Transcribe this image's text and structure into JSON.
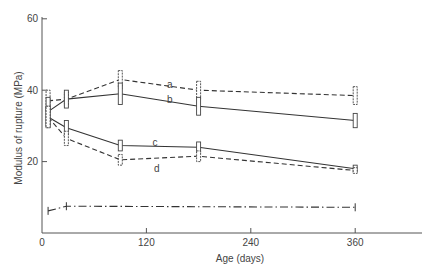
{
  "chart_data": {
    "type": "line",
    "title": "",
    "xlabel": "Age (days)",
    "ylabel": "Modulus of rupture (MPa)",
    "xlim": [
      0,
      440
    ],
    "ylim": [
      0,
      62
    ],
    "xticks": [
      0,
      120,
      240,
      360
    ],
    "yticks": [
      20,
      40,
      60
    ],
    "grid": false,
    "legend": "inline labels",
    "series": [
      {
        "name": "a",
        "style": "dashed",
        "x": [
          7,
          28,
          90,
          180,
          360
        ],
        "y": [
          37,
          37.5,
          43,
          40,
          38.5
        ],
        "error": [
          3,
          2,
          2.5,
          2.5,
          2.5
        ],
        "label_pos": [
          147,
          40.5
        ]
      },
      {
        "name": "b",
        "style": "solid",
        "x": [
          7,
          28,
          90,
          180,
          360
        ],
        "y": [
          34,
          37.5,
          39,
          35.5,
          31.5
        ],
        "error": [
          4,
          2.5,
          3,
          2.5,
          2
        ],
        "label_pos": [
          147,
          36.5
        ]
      },
      {
        "name": "c",
        "style": "solid",
        "x": [
          7,
          28,
          90,
          180,
          360
        ],
        "y": [
          32.5,
          29.5,
          24.5,
          24,
          18
        ],
        "error": [
          3,
          2,
          1.5,
          1.5,
          1
        ],
        "label_pos": [
          130,
          24.5
        ]
      },
      {
        "name": "d",
        "style": "dashed",
        "x": [
          7,
          28,
          90,
          180,
          360
        ],
        "y": [
          32.5,
          26.5,
          20.5,
          21.5,
          17.5
        ],
        "error": [
          3,
          2,
          1.5,
          1.5,
          0.8
        ],
        "label_pos": [
          132,
          17
        ]
      },
      {
        "name": "",
        "style": "dashdot",
        "x": [
          7,
          28,
          360
        ],
        "y": [
          6.2,
          7.5,
          7.2
        ],
        "error": [
          0.8,
          0.8,
          0.8
        ],
        "label_pos": null
      }
    ]
  },
  "axes": {
    "xlabel": "Age (days)",
    "ylabel": "Modulus of rupture (MPa)",
    "xtick_labels": [
      "0",
      "120",
      "240",
      "360"
    ],
    "ytick_labels": [
      "20",
      "40",
      "60"
    ]
  }
}
